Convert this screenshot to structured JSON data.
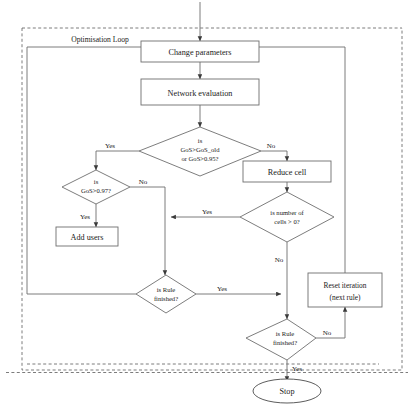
{
  "diagram": {
    "title_label": "Optimisation Loop",
    "nodes": {
      "change_parameters": "Change parameters",
      "network_evaluation": "Network evaluation",
      "gos_check_l1": "is",
      "gos_check_l2": "GoS>GoS_old",
      "gos_check_l3": "or GoS>0.95?",
      "reduce_cell": "Reduce cell",
      "gos97_l1": "is",
      "gos97_l2": "GoS>0.97?",
      "add_users": "Add users",
      "cells_l1": "is number of",
      "cells_l2": "cells > 0?",
      "rule_fin1_l1": "is Rule",
      "rule_fin1_l2": "finished?",
      "reset_l1": "Reset iteration",
      "reset_l2": "(next rule)",
      "rule_fin2_l1": "is Rule",
      "rule_fin2_l2": "finished?",
      "stop": "Stop"
    },
    "edges": {
      "yes_gos": "Yes",
      "no_gos": "No",
      "no_gos97": "No",
      "yes_gos97": "Yes",
      "yes_cells": "Yes",
      "no_cells": "No",
      "yes_rule1": "Yes",
      "no_rule2": "No",
      "yes_rule2": "Yes"
    },
    "colors": {
      "stroke": "#6e6e6e",
      "text": "#1a1a1a",
      "background": "#ffffff",
      "dashed_border": "#5a5a5a"
    }
  }
}
